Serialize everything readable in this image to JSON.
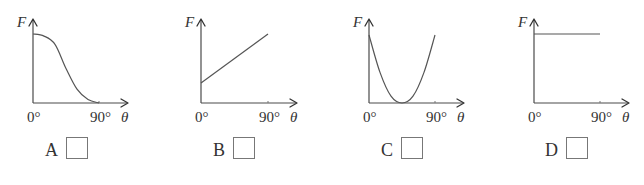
{
  "panels": [
    {
      "option": "A",
      "y_label": "F",
      "x_label": "θ",
      "x_ticks": [
        "0°",
        "90°"
      ],
      "description": "F decreases from maximum at 0° in an S-shaped curve to zero at 90°",
      "curve": {
        "type": "sigmoid-decreasing",
        "points": [
          [
            0,
            1.0
          ],
          [
            15,
            0.97
          ],
          [
            30,
            0.85
          ],
          [
            45,
            0.5
          ],
          [
            60,
            0.2
          ],
          [
            75,
            0.05
          ],
          [
            90,
            0.0
          ]
        ]
      }
    },
    {
      "option": "B",
      "y_label": "F",
      "x_label": "θ",
      "x_ticks": [
        "0°",
        "90°"
      ],
      "description": "F increases linearly from a positive value at 0° to 90°",
      "curve": {
        "type": "linear",
        "points": [
          [
            0,
            0.29
          ],
          [
            90,
            1.0
          ]
        ]
      }
    },
    {
      "option": "C",
      "y_label": "F",
      "x_label": "θ",
      "x_ticks": [
        "0°",
        "90°"
      ],
      "description": "F follows a U-shaped parabola, minimum of zero near 45°",
      "curve": {
        "type": "parabola",
        "points": [
          [
            0,
            1.0
          ],
          [
            15,
            0.45
          ],
          [
            30,
            0.1
          ],
          [
            45,
            0.0
          ],
          [
            60,
            0.1
          ],
          [
            75,
            0.45
          ],
          [
            90,
            1.0
          ]
        ]
      }
    },
    {
      "option": "D",
      "y_label": "F",
      "x_label": "θ",
      "x_ticks": [
        "0°",
        "90°"
      ],
      "description": "F is constant from 0° to 90°",
      "curve": {
        "type": "constant",
        "points": [
          [
            0,
            1.0
          ],
          [
            90,
            1.0
          ]
        ]
      }
    }
  ],
  "answer_boxes": [
    {
      "option": "A",
      "checked": false
    },
    {
      "option": "B",
      "checked": false
    },
    {
      "option": "C",
      "checked": false
    },
    {
      "option": "D",
      "checked": false
    }
  ]
}
